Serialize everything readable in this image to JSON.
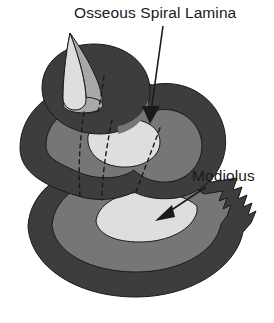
{
  "figure": {
    "background_color": "#ffffff"
  },
  "palette": {
    "dark_gray": "#3d3d3d",
    "medium_gray": "#767676",
    "light_gray": "#cfcfcf",
    "pale_gray": "#dedede",
    "outline": "#1a1a1a",
    "label_color": "#1a1a1a"
  },
  "labels": [
    {
      "id": "osseous-spiral-lamina",
      "text": "Osseous Spiral Lamina",
      "x": 74,
      "y": 18,
      "anchor": "start",
      "leader": {
        "from_x": 163,
        "from_y": 26,
        "to_x": 150,
        "to_y": 122
      }
    },
    {
      "id": "modiolus",
      "text": "Modiolus",
      "x": 192,
      "y": 181,
      "anchor": "start",
      "leader": {
        "from_x": 206,
        "from_y": 187,
        "to_x": 157,
        "to_y": 219
      }
    }
  ],
  "parts": [
    {
      "id": "apical-cone",
      "name": "Apical cone (helicotrema spire)",
      "fill": "#dedede"
    },
    {
      "id": "apical-cone-shadow",
      "name": "Apical cone shaded side",
      "fill": "#a8a8a8"
    },
    {
      "id": "upper-turn",
      "name": "Upper cochlear turn",
      "fill": "#3d3d3d"
    },
    {
      "id": "middle-turn",
      "name": "Middle cochlear turn",
      "fill": "#3d3d3d"
    },
    {
      "id": "middle-turn-band",
      "name": "Middle turn scala band",
      "fill": "#767676"
    },
    {
      "id": "middle-turn-core",
      "name": "Middle turn inner core",
      "fill": "#dedede"
    },
    {
      "id": "basal-turn",
      "name": "Basal cochlear turn",
      "fill": "#3d3d3d"
    },
    {
      "id": "basal-turn-band",
      "name": "Basal turn scala band",
      "fill": "#767676"
    },
    {
      "id": "basal-turn-core",
      "name": "Basal turn inner core (modiolus face)",
      "fill": "#dedede"
    },
    {
      "id": "serrated-edge",
      "name": "Serrated cut edge",
      "fill": "#3d3d3d"
    },
    {
      "id": "hidden-edge-lines",
      "name": "Dashed hidden edges",
      "stroke": "#1a1a1a"
    }
  ]
}
